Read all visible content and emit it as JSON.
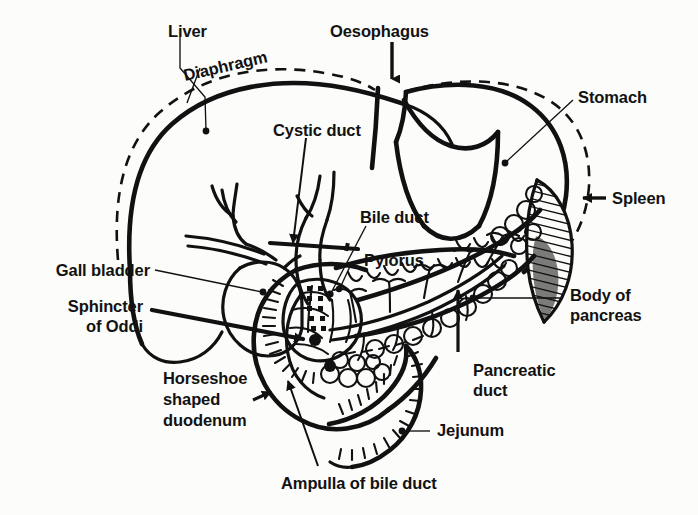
{
  "figure": {
    "kind": "anatomical-line-diagram",
    "background_color": "#fcfcfb",
    "ink_color": "#111111",
    "width": 698,
    "height": 515
  },
  "labels": {
    "liver": "Liver",
    "diaphragm": "Diaphragm",
    "oesophagus": "Oesophagus",
    "stomach": "Stomach",
    "spleen": "Spleen",
    "cystic_duct": "Cystic duct",
    "bile_duct": "Bile duct",
    "pylorus": "Pylorus",
    "gall_bladder": "Gall bladder",
    "sphincter_of_oddi_line1": "Sphincter",
    "sphincter_of_oddi_line2": "of Oddi",
    "body_of_pancreas_line1": "Body of",
    "body_of_pancreas_line2": "pancreas",
    "pancreatic_duct_line1": "Pancreatic",
    "pancreatic_duct_line2": "duct",
    "horseshoe_line1": "Horseshoe",
    "horseshoe_line2": "shaped",
    "horseshoe_line3": "duodenum",
    "jejunum": "Jejunum",
    "ampulla_of_bile_duct": "Ampulla of bile duct"
  },
  "label_positions": {
    "liver": {
      "x": 168,
      "y": 22,
      "align": "left"
    },
    "diaphragm": {
      "x": 186,
      "y": 84,
      "align": "left",
      "rotate": -13
    },
    "oesophagus": {
      "x": 330,
      "y": 22,
      "align": "left"
    },
    "stomach": {
      "x": 578,
      "y": 88,
      "align": "left"
    },
    "spleen": {
      "x": 612,
      "y": 192,
      "align": "left"
    },
    "cystic_duct": {
      "x": 273,
      "y": 121,
      "align": "left"
    },
    "bile_duct": {
      "x": 360,
      "y": 211,
      "align": "left"
    },
    "pylorus": {
      "x": 364,
      "y": 253,
      "align": "left"
    },
    "gall_bladder": {
      "x": 150,
      "y": 260,
      "align": "right"
    },
    "sphincter": {
      "x": 143,
      "y": 297,
      "align": "right"
    },
    "body_pancreas": {
      "x": 570,
      "y": 288,
      "align": "left"
    },
    "pancreatic": {
      "x": 473,
      "y": 363,
      "align": "left"
    },
    "horseshoe": {
      "x": 163,
      "y": 371,
      "align": "left"
    },
    "jejunum": {
      "x": 437,
      "y": 423,
      "align": "left"
    },
    "ampulla": {
      "x": 281,
      "y": 478,
      "align": "left"
    }
  },
  "structures": [
    "liver-outline",
    "diaphragm-dashed-line",
    "oesophagus",
    "stomach-body",
    "pylorus-antrum",
    "spleen-hatched",
    "gall-bladder",
    "cystic-duct",
    "hepatic-ducts",
    "common-bile-duct",
    "pancreas-head",
    "pancreas-body-tail",
    "pancreatic-duct",
    "duodenum-horseshoe",
    "ampulla-of-vater",
    "sphincter-of-oddi",
    "jejunum-loop"
  ],
  "pointer_types": {
    "liver": "line-with-dot",
    "diaphragm": "line-with-dot",
    "oesophagus": "arrow-down",
    "stomach": "line-with-dot",
    "spleen": "arrow-left",
    "cystic_duct": "arrow-down-left",
    "bile_duct": "line-with-dot",
    "pylorus": "line-with-dot",
    "gall_bladder": "line-with-dot",
    "sphincter_of_oddi": "thick-line-with-arrow",
    "body_of_pancreas": "line-with-dot",
    "pancreatic_duct": "arrow-up",
    "horseshoe_shaped_duodenum": "short-arrow",
    "jejunum": "line-with-dot",
    "ampulla_of_bile_duct": "arrow-up-left"
  }
}
